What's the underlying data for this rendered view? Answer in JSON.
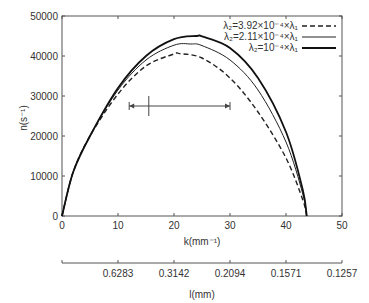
{
  "chart_data": {
    "type": "line",
    "title": "",
    "xlabel": "k(mm⁻¹)",
    "ylabel": "n(s⁻¹)",
    "secondary_xlabel": "l(mm)",
    "xlim": [
      0,
      50
    ],
    "ylim": [
      0,
      50000
    ],
    "xticks": [
      "0",
      "10",
      "20",
      "30",
      "40",
      "50"
    ],
    "yticks": [
      "0",
      "10000",
      "20000",
      "30000",
      "40000",
      "50000"
    ],
    "secondary_xticks": [
      "0.6283",
      "0.3142",
      "0.2094",
      "0.1571",
      "0.1257"
    ],
    "secondary_xtick_positions": [
      10,
      20,
      30,
      40,
      50
    ],
    "legend_position": "upper right",
    "grid": false,
    "annotation": {
      "type": "range-arrow",
      "x_from": 12,
      "x_to": 30,
      "marker_x": 15.5,
      "y": 32000
    },
    "series": [
      {
        "name": "λ2=3.92×10⁻⁴×λ1",
        "style": "dashed",
        "x": [
          0,
          2,
          5,
          10,
          15,
          20,
          21,
          25,
          30,
          35,
          40,
          43,
          43.7
        ],
        "y": [
          0,
          11000,
          20000,
          30500,
          37500,
          40500,
          40600,
          39500,
          34500,
          26000,
          14500,
          4000,
          0
        ]
      },
      {
        "name": "λ2=2.11×10⁻⁴×λ1",
        "style": "solid-thin",
        "x": [
          0,
          2,
          5,
          10,
          15,
          20,
          23,
          25,
          30,
          35,
          40,
          43,
          43.7
        ],
        "y": [
          0,
          11000,
          20000,
          31500,
          39000,
          42700,
          43000,
          42600,
          39000,
          31500,
          18500,
          5500,
          0
        ]
      },
      {
        "name": "λ2=10⁻⁴×λ1",
        "style": "solid-thick",
        "x": [
          0,
          2,
          5,
          10,
          15,
          20,
          24,
          25,
          30,
          35,
          40,
          43,
          43.7
        ],
        "y": [
          0,
          11000,
          20000,
          32000,
          40000,
          44200,
          45000,
          44900,
          42000,
          34500,
          21000,
          6500,
          0
        ]
      }
    ]
  },
  "legend": {
    "entries": [
      {
        "label": "λ₂=3.92×10⁻⁴×λ₁"
      },
      {
        "label": "λ₂=2.11×10⁻⁴×λ₁"
      },
      {
        "label": "λ₂=10⁻⁴×λ₁"
      }
    ]
  },
  "axes": {
    "xlabel": "k(mm⁻¹)",
    "ylabel": "n(s⁻¹)",
    "x2label": "l(mm)"
  }
}
